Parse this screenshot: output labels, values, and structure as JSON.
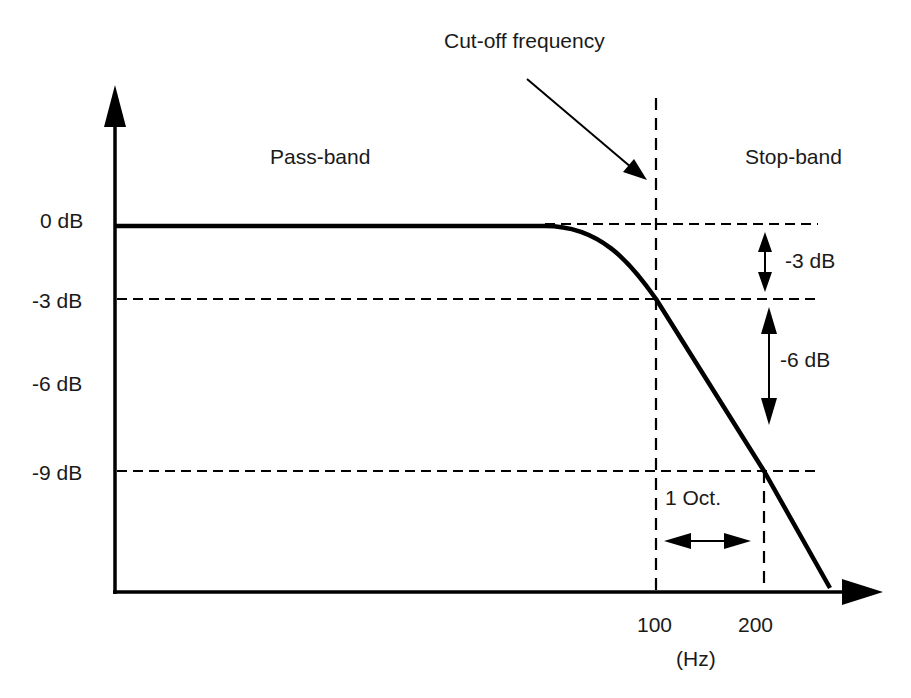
{
  "title": "Cut-off frequency",
  "regions": {
    "pass_band": "Pass-band",
    "stop_band": "Stop-band"
  },
  "y_ticks": [
    "0 dB",
    "-3 dB",
    "-6 dB",
    "-9 dB"
  ],
  "x_ticks": [
    "100",
    "200"
  ],
  "x_unit": "(Hz)",
  "annotations": {
    "minus3": "-3 dB",
    "minus6": "-6 dB",
    "octave": "1 Oct."
  },
  "colors": {
    "line": "#000000",
    "background": "#ffffff"
  }
}
